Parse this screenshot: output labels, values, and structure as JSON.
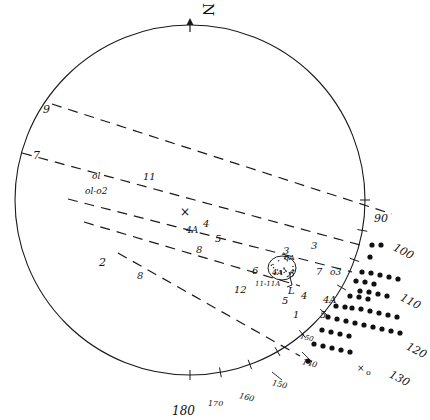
{
  "figure": {
    "type": "stereonet-projection",
    "north_label": "N",
    "primitive_circle": {
      "cx": 190,
      "cy": 200,
      "r": 175
    }
  },
  "azimuth_ticks": [
    {
      "label": "90",
      "x": 374,
      "y": 213,
      "size": 11
    },
    {
      "label": "100",
      "x": 393,
      "y": 246,
      "size": 11
    },
    {
      "label": "110",
      "x": 400,
      "y": 296,
      "size": 11
    },
    {
      "label": "120",
      "x": 406,
      "y": 345,
      "size": 11
    },
    {
      "label": "130",
      "x": 389,
      "y": 373,
      "size": 11
    },
    {
      "label": "140",
      "x": 302,
      "y": 360,
      "size": 8
    },
    {
      "label": "150",
      "x": 272,
      "y": 381,
      "size": 8
    },
    {
      "label": "160",
      "x": 239,
      "y": 394,
      "size": 8
    },
    {
      "label": "170",
      "x": 208,
      "y": 400,
      "size": 8
    },
    {
      "label": "180",
      "x": 172,
      "y": 405,
      "size": 12
    },
    {
      "label": "150",
      "x": 300,
      "y": 335,
      "size": 7
    }
  ],
  "contour_labels": [
    {
      "label": "9",
      "x": 43,
      "y": 104,
      "size": 11
    },
    {
      "label": "7",
      "x": 33,
      "y": 150,
      "size": 11
    },
    {
      "label": "ol",
      "x": 92,
      "y": 172,
      "size": 9
    },
    {
      "label": "ol-o2",
      "x": 85,
      "y": 187,
      "size": 9
    },
    {
      "label": "11",
      "x": 143,
      "y": 172,
      "size": 10
    },
    {
      "label": "4A",
      "x": 186,
      "y": 226,
      "size": 9
    },
    {
      "label": "4",
      "x": 203,
      "y": 219,
      "size": 10
    },
    {
      "label": "5",
      "x": 215,
      "y": 234,
      "size": 10
    },
    {
      "label": "8",
      "x": 196,
      "y": 245,
      "size": 10
    },
    {
      "label": "2",
      "x": 99,
      "y": 257,
      "size": 11
    },
    {
      "label": "8",
      "x": 137,
      "y": 271,
      "size": 10
    },
    {
      "label": "6",
      "x": 252,
      "y": 266,
      "size": 10
    },
    {
      "label": "12",
      "x": 234,
      "y": 285,
      "size": 10
    },
    {
      "label": "11-11A",
      "x": 255,
      "y": 281,
      "size": 7
    },
    {
      "label": "8A",
      "x": 284,
      "y": 254,
      "size": 8
    },
    {
      "label": "4A",
      "x": 272,
      "y": 269,
      "size": 8
    },
    {
      "label": "6",
      "x": 289,
      "y": 270,
      "size": 9
    },
    {
      "label": "L",
      "x": 288,
      "y": 286,
      "size": 10
    },
    {
      "label": "5",
      "x": 282,
      "y": 296,
      "size": 10
    },
    {
      "label": "4",
      "x": 301,
      "y": 291,
      "size": 10
    },
    {
      "label": "1",
      "x": 293,
      "y": 310,
      "size": 10
    },
    {
      "label": "3",
      "x": 283,
      "y": 246,
      "size": 10
    },
    {
      "label": "3",
      "x": 311,
      "y": 241,
      "size": 10
    },
    {
      "label": "7",
      "x": 316,
      "y": 267,
      "size": 10
    },
    {
      "label": "o3",
      "x": 330,
      "y": 268,
      "size": 9
    },
    {
      "label": "4A",
      "x": 323,
      "y": 295,
      "size": 10
    },
    {
      "label": "5",
      "x": 320,
      "y": 310,
      "size": 10
    }
  ],
  "symbols": [
    {
      "name": "cross-marker",
      "glyph": "×",
      "x": 180,
      "y": 206,
      "size": 12
    },
    {
      "name": "x-marker",
      "glyph": "×",
      "x": 357,
      "y": 364,
      "size": 9
    },
    {
      "name": "circle-marker",
      "glyph": "o",
      "x": 366,
      "y": 369,
      "size": 8
    }
  ],
  "dot_field": {
    "name": "data-point-dots",
    "radius": 2.6,
    "color": "#111111",
    "rows": [
      [
        [
          372,
          245
        ],
        [
          381,
          245
        ]
      ],
      [
        [
          370,
          257
        ]
      ],
      [
        [
          362,
          272
        ],
        [
          371,
          273
        ],
        [
          380,
          275
        ],
        [
          389,
          277
        ],
        [
          398,
          279
        ]
      ],
      [
        [
          356,
          281
        ],
        [
          365,
          282
        ],
        [
          374,
          284
        ]
      ],
      [
        [
          360,
          291
        ],
        [
          369,
          292
        ],
        [
          378,
          294
        ],
        [
          387,
          296
        ]
      ],
      [
        [
          350,
          296
        ],
        [
          359,
          297
        ],
        [
          368,
          299
        ]
      ],
      [
        [
          352,
          308
        ],
        [
          361,
          309
        ],
        [
          370,
          311
        ],
        [
          379,
          313
        ],
        [
          388,
          315
        ],
        [
          397,
          317
        ]
      ],
      [
        [
          336,
          306
        ],
        [
          345,
          307
        ]
      ],
      [
        [
          328,
          317
        ],
        [
          337,
          319
        ],
        [
          346,
          321
        ],
        [
          355,
          323
        ],
        [
          364,
          325
        ],
        [
          373,
          327
        ],
        [
          382,
          329
        ],
        [
          391,
          331
        ],
        [
          400,
          333
        ]
      ],
      [
        [
          322,
          330
        ],
        [
          331,
          332
        ],
        [
          340,
          334
        ],
        [
          349,
          336
        ]
      ],
      [
        [
          314,
          344
        ],
        [
          323,
          346
        ],
        [
          332,
          348
        ],
        [
          341,
          350
        ],
        [
          350,
          352
        ]
      ],
      [
        [
          308,
          361
        ]
      ]
    ]
  },
  "dashed_lines": [
    {
      "name": "contour-9",
      "x1": 52,
      "y1": 104,
      "x2": 392,
      "y2": 214
    },
    {
      "name": "contour-7",
      "x1": 22,
      "y1": 153,
      "x2": 360,
      "y2": 245
    },
    {
      "name": "contour-ol",
      "x1": 68,
      "y1": 199,
      "x2": 352,
      "y2": 272
    },
    {
      "name": "contour-mid",
      "x1": 84,
      "y1": 222,
      "x2": 300,
      "y2": 286
    },
    {
      "name": "contour-lower",
      "x1": 118,
      "y1": 253,
      "x2": 300,
      "y2": 356
    }
  ]
}
